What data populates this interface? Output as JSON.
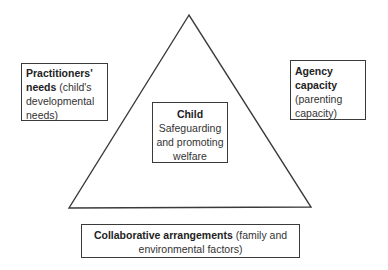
{
  "diagram": {
    "type": "triangle-framework",
    "colors": {
      "line": "#3a3a3a",
      "text": "#333333",
      "background": "#ffffff"
    },
    "triangle": {
      "apex": [
        189,
        15
      ],
      "bottom_left": [
        69,
        208
      ],
      "bottom_right": [
        311,
        207
      ]
    },
    "nodes": {
      "left": {
        "title": "Practitioners'",
        "title2": "needs",
        "detail": " (child's",
        "detail2": "developmental",
        "detail3": "needs)"
      },
      "right": {
        "title": "Agency",
        "title2": "capacity",
        "detail": "(parenting",
        "detail2": "capacity)"
      },
      "center": {
        "title": "Child",
        "detail": "Safeguarding",
        "detail2": "and promoting",
        "detail3": "welfare"
      },
      "bottom": {
        "title": "Collaborative arrangements",
        "detail": " (family and",
        "detail2": "environmental factors)"
      }
    }
  }
}
